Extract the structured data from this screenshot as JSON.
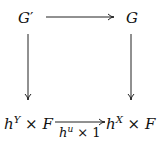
{
  "diagram": {
    "type": "commutative-square",
    "nodes": {
      "top_left": {
        "base": "G",
        "prime": "′"
      },
      "top_right": {
        "base": "G"
      },
      "bottom_left": {
        "base": "h",
        "sup": "Y",
        "times": "×",
        "factor": "F"
      },
      "bottom_right": {
        "base": "h",
        "sup": "X",
        "times": "×",
        "factor": "F"
      }
    },
    "arrows": [
      {
        "from": "top_left",
        "to": "top_right",
        "label": ""
      },
      {
        "from": "top_left",
        "to": "bottom_left",
        "label": ""
      },
      {
        "from": "top_right",
        "to": "bottom_right",
        "label": ""
      },
      {
        "from": "bottom_left",
        "to": "bottom_right",
        "label_base": "h",
        "label_sup": "u",
        "label_times": "×",
        "label_one": "1"
      }
    ],
    "stroke_color": "#222222"
  }
}
